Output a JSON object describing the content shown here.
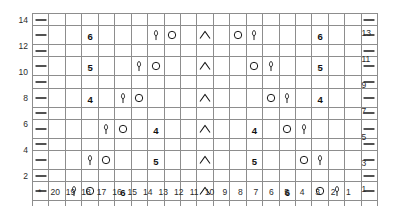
{
  "chart_data": {
    "type": "table",
    "grid": {
      "columns": 21,
      "rows": 14
    },
    "column_labels": [
      "*",
      "20",
      "19",
      "18",
      "17",
      "16",
      "15",
      "14",
      "13",
      "12",
      "11",
      "10",
      "9",
      "8",
      "7",
      "6",
      "5",
      "4",
      "3",
      "2",
      "1"
    ],
    "row_labels_left": [
      "14",
      "",
      "12",
      "",
      "10",
      "",
      "8",
      "",
      "6",
      "",
      "4",
      "",
      "2",
      ""
    ],
    "row_labels_right": [
      "",
      "13",
      "",
      "11",
      "",
      "9",
      "",
      "7",
      "",
      "5",
      "",
      "3",
      "",
      "1"
    ],
    "row_order_top_to_bottom": [
      14,
      13,
      12,
      11,
      10,
      9,
      8,
      7,
      6,
      5,
      4,
      3,
      2,
      1
    ],
    "symbol_legend": {
      "dash": "purl / selvedge marker",
      "circle": "yarn over",
      "lifted": "make-one lifted stitch",
      "chevron": "centered double decrease",
      "number": "cable or repeat count"
    },
    "colors": {
      "grid_line": "#8d8d8d",
      "frame": "#5a5a5a",
      "symbol": "#1a1a1a",
      "label": "#2b2b2b"
    },
    "rows": [
      {
        "row": 14,
        "cells": [
          {
            "col": "*",
            "symbol": "dash"
          },
          {
            "col": "20"
          },
          {
            "col": "19"
          },
          {
            "col": "18"
          },
          {
            "col": "17"
          },
          {
            "col": "16"
          },
          {
            "col": "15"
          },
          {
            "col": "14"
          },
          {
            "col": "13"
          },
          {
            "col": "12"
          },
          {
            "col": "11"
          },
          {
            "col": "10"
          },
          {
            "col": "9"
          },
          {
            "col": "8"
          },
          {
            "col": "7"
          },
          {
            "col": "6"
          },
          {
            "col": "5"
          },
          {
            "col": "4"
          },
          {
            "col": "3"
          },
          {
            "col": "2"
          },
          {
            "col": "1",
            "symbol": "dash"
          }
        ]
      },
      {
        "row": 13,
        "cells": [
          {
            "col": "*",
            "symbol": "dash"
          },
          {
            "col": "20"
          },
          {
            "col": "19"
          },
          {
            "col": "18",
            "symbol": "number",
            "text": "6"
          },
          {
            "col": "17"
          },
          {
            "col": "16"
          },
          {
            "col": "15"
          },
          {
            "col": "14",
            "symbol": "lifted"
          },
          {
            "col": "13",
            "symbol": "circle"
          },
          {
            "col": "12"
          },
          {
            "col": "11",
            "symbol": "chevron"
          },
          {
            "col": "10"
          },
          {
            "col": "9",
            "symbol": "circle"
          },
          {
            "col": "8",
            "symbol": "lifted"
          },
          {
            "col": "7"
          },
          {
            "col": "6"
          },
          {
            "col": "5"
          },
          {
            "col": "4",
            "symbol": "number",
            "text": "6"
          },
          {
            "col": "3"
          },
          {
            "col": "2"
          },
          {
            "col": "1",
            "symbol": "dash"
          }
        ]
      },
      {
        "row": 12,
        "cells": [
          {
            "col": "*",
            "symbol": "dash"
          },
          {
            "col": "20"
          },
          {
            "col": "19"
          },
          {
            "col": "18"
          },
          {
            "col": "17"
          },
          {
            "col": "16"
          },
          {
            "col": "15"
          },
          {
            "col": "14"
          },
          {
            "col": "13"
          },
          {
            "col": "12"
          },
          {
            "col": "11"
          },
          {
            "col": "10"
          },
          {
            "col": "9"
          },
          {
            "col": "8"
          },
          {
            "col": "7"
          },
          {
            "col": "6"
          },
          {
            "col": "5"
          },
          {
            "col": "4"
          },
          {
            "col": "3"
          },
          {
            "col": "2"
          },
          {
            "col": "1",
            "symbol": "dash"
          }
        ]
      },
      {
        "row": 11,
        "cells": [
          {
            "col": "*",
            "symbol": "dash"
          },
          {
            "col": "20"
          },
          {
            "col": "19"
          },
          {
            "col": "18",
            "symbol": "number",
            "text": "5"
          },
          {
            "col": "17"
          },
          {
            "col": "16"
          },
          {
            "col": "15",
            "symbol": "lifted"
          },
          {
            "col": "14",
            "symbol": "circle"
          },
          {
            "col": "13"
          },
          {
            "col": "12"
          },
          {
            "col": "11",
            "symbol": "chevron"
          },
          {
            "col": "10"
          },
          {
            "col": "9"
          },
          {
            "col": "8",
            "symbol": "circle"
          },
          {
            "col": "7",
            "symbol": "lifted"
          },
          {
            "col": "6"
          },
          {
            "col": "5"
          },
          {
            "col": "4",
            "symbol": "number",
            "text": "5"
          },
          {
            "col": "3"
          },
          {
            "col": "2"
          },
          {
            "col": "1",
            "symbol": "dash"
          }
        ]
      },
      {
        "row": 10,
        "cells": [
          {
            "col": "*",
            "symbol": "dash"
          },
          {
            "col": "20"
          },
          {
            "col": "19"
          },
          {
            "col": "18"
          },
          {
            "col": "17"
          },
          {
            "col": "16"
          },
          {
            "col": "15"
          },
          {
            "col": "14"
          },
          {
            "col": "13"
          },
          {
            "col": "12"
          },
          {
            "col": "11"
          },
          {
            "col": "10"
          },
          {
            "col": "9"
          },
          {
            "col": "8"
          },
          {
            "col": "7"
          },
          {
            "col": "6"
          },
          {
            "col": "5"
          },
          {
            "col": "4"
          },
          {
            "col": "3"
          },
          {
            "col": "2"
          },
          {
            "col": "1",
            "symbol": "dash"
          }
        ]
      },
      {
        "row": 9,
        "cells": [
          {
            "col": "*",
            "symbol": "dash"
          },
          {
            "col": "20"
          },
          {
            "col": "19"
          },
          {
            "col": "18",
            "symbol": "number",
            "text": "4"
          },
          {
            "col": "17"
          },
          {
            "col": "16",
            "symbol": "lifted"
          },
          {
            "col": "15",
            "symbol": "circle"
          },
          {
            "col": "14"
          },
          {
            "col": "13"
          },
          {
            "col": "12"
          },
          {
            "col": "11",
            "symbol": "chevron"
          },
          {
            "col": "10"
          },
          {
            "col": "9"
          },
          {
            "col": "8"
          },
          {
            "col": "7",
            "symbol": "circle"
          },
          {
            "col": "6",
            "symbol": "lifted"
          },
          {
            "col": "5"
          },
          {
            "col": "4",
            "symbol": "number",
            "text": "4"
          },
          {
            "col": "3"
          },
          {
            "col": "2"
          },
          {
            "col": "1",
            "symbol": "dash"
          }
        ]
      },
      {
        "row": 8,
        "cells": [
          {
            "col": "*",
            "symbol": "dash"
          },
          {
            "col": "20"
          },
          {
            "col": "19"
          },
          {
            "col": "18"
          },
          {
            "col": "17"
          },
          {
            "col": "16"
          },
          {
            "col": "15"
          },
          {
            "col": "14"
          },
          {
            "col": "13"
          },
          {
            "col": "12"
          },
          {
            "col": "11"
          },
          {
            "col": "10"
          },
          {
            "col": "9"
          },
          {
            "col": "8"
          },
          {
            "col": "7"
          },
          {
            "col": "6"
          },
          {
            "col": "5"
          },
          {
            "col": "4"
          },
          {
            "col": "3"
          },
          {
            "col": "2"
          },
          {
            "col": "1",
            "symbol": "dash"
          }
        ]
      },
      {
        "row": 7,
        "cells": [
          {
            "col": "*",
            "symbol": "dash"
          },
          {
            "col": "20"
          },
          {
            "col": "19"
          },
          {
            "col": "18"
          },
          {
            "col": "17",
            "symbol": "lifted"
          },
          {
            "col": "16",
            "symbol": "circle"
          },
          {
            "col": "15"
          },
          {
            "col": "14",
            "symbol": "number",
            "text": "4"
          },
          {
            "col": "13"
          },
          {
            "col": "12"
          },
          {
            "col": "11",
            "symbol": "chevron"
          },
          {
            "col": "10"
          },
          {
            "col": "9"
          },
          {
            "col": "8",
            "symbol": "number",
            "text": "4"
          },
          {
            "col": "7"
          },
          {
            "col": "6",
            "symbol": "circle"
          },
          {
            "col": "5",
            "symbol": "lifted"
          },
          {
            "col": "4"
          },
          {
            "col": "3"
          },
          {
            "col": "2"
          },
          {
            "col": "1",
            "symbol": "dash"
          }
        ]
      },
      {
        "row": 6,
        "cells": [
          {
            "col": "*",
            "symbol": "dash"
          },
          {
            "col": "20"
          },
          {
            "col": "19"
          },
          {
            "col": "18"
          },
          {
            "col": "17"
          },
          {
            "col": "16"
          },
          {
            "col": "15"
          },
          {
            "col": "14"
          },
          {
            "col": "13"
          },
          {
            "col": "12"
          },
          {
            "col": "11"
          },
          {
            "col": "10"
          },
          {
            "col": "9"
          },
          {
            "col": "8"
          },
          {
            "col": "7"
          },
          {
            "col": "6"
          },
          {
            "col": "5"
          },
          {
            "col": "4"
          },
          {
            "col": "3"
          },
          {
            "col": "2"
          },
          {
            "col": "1",
            "symbol": "dash"
          }
        ]
      },
      {
        "row": 5,
        "cells": [
          {
            "col": "*",
            "symbol": "dash"
          },
          {
            "col": "20"
          },
          {
            "col": "19"
          },
          {
            "col": "18",
            "symbol": "lifted"
          },
          {
            "col": "17",
            "symbol": "circle"
          },
          {
            "col": "16"
          },
          {
            "col": "15"
          },
          {
            "col": "14",
            "symbol": "number",
            "text": "5"
          },
          {
            "col": "13"
          },
          {
            "col": "12"
          },
          {
            "col": "11",
            "symbol": "chevron"
          },
          {
            "col": "10"
          },
          {
            "col": "9"
          },
          {
            "col": "8",
            "symbol": "number",
            "text": "5"
          },
          {
            "col": "7"
          },
          {
            "col": "6"
          },
          {
            "col": "5",
            "symbol": "circle"
          },
          {
            "col": "4",
            "symbol": "lifted"
          },
          {
            "col": "3"
          },
          {
            "col": "2"
          },
          {
            "col": "1",
            "symbol": "dash"
          }
        ]
      },
      {
        "row": 4,
        "cells": [
          {
            "col": "*",
            "symbol": "dash"
          },
          {
            "col": "20"
          },
          {
            "col": "19"
          },
          {
            "col": "18"
          },
          {
            "col": "17"
          },
          {
            "col": "16"
          },
          {
            "col": "15"
          },
          {
            "col": "14"
          },
          {
            "col": "13"
          },
          {
            "col": "12"
          },
          {
            "col": "11"
          },
          {
            "col": "10"
          },
          {
            "col": "9"
          },
          {
            "col": "8"
          },
          {
            "col": "7"
          },
          {
            "col": "6"
          },
          {
            "col": "5"
          },
          {
            "col": "4"
          },
          {
            "col": "3"
          },
          {
            "col": "2"
          },
          {
            "col": "1",
            "symbol": "dash"
          }
        ]
      },
      {
        "row": 3,
        "cells": [
          {
            "col": "*",
            "symbol": "dash"
          },
          {
            "col": "20"
          },
          {
            "col": "19",
            "symbol": "lifted"
          },
          {
            "col": "18",
            "symbol": "circle"
          },
          {
            "col": "17"
          },
          {
            "col": "16",
            "symbol": "number",
            "text": "6"
          },
          {
            "col": "15"
          },
          {
            "col": "14"
          },
          {
            "col": "13"
          },
          {
            "col": "12"
          },
          {
            "col": "11",
            "symbol": "chevron"
          },
          {
            "col": "10"
          },
          {
            "col": "9"
          },
          {
            "col": "8"
          },
          {
            "col": "7"
          },
          {
            "col": "6",
            "symbol": "number",
            "text": "6"
          },
          {
            "col": "5"
          },
          {
            "col": "4",
            "symbol": "circle"
          },
          {
            "col": "3",
            "symbol": "lifted"
          },
          {
            "col": "2"
          },
          {
            "col": "1",
            "symbol": "dash"
          }
        ]
      },
      {
        "row": 2,
        "cells": [
          {
            "col": "*",
            "symbol": "dash"
          },
          {
            "col": "20"
          },
          {
            "col": "19"
          },
          {
            "col": "18"
          },
          {
            "col": "17"
          },
          {
            "col": "16"
          },
          {
            "col": "15"
          },
          {
            "col": "14"
          },
          {
            "col": "13"
          },
          {
            "col": "12"
          },
          {
            "col": "11"
          },
          {
            "col": "10"
          },
          {
            "col": "9"
          },
          {
            "col": "8"
          },
          {
            "col": "7"
          },
          {
            "col": "6"
          },
          {
            "col": "5"
          },
          {
            "col": "4"
          },
          {
            "col": "3"
          },
          {
            "col": "2"
          },
          {
            "col": "1",
            "symbol": "dash"
          }
        ]
      },
      {
        "row": 1,
        "cells": [
          {
            "col": "*",
            "symbol": "dash"
          },
          {
            "col": "20"
          },
          {
            "col": "19",
            "symbol": "circle"
          },
          {
            "col": "18"
          },
          {
            "col": "17"
          },
          {
            "col": "16",
            "symbol": "number",
            "text": "7"
          },
          {
            "col": "15"
          },
          {
            "col": "14"
          },
          {
            "col": "13"
          },
          {
            "col": "12"
          },
          {
            "col": "11",
            "symbol": "chevron"
          },
          {
            "col": "10"
          },
          {
            "col": "9"
          },
          {
            "col": "8"
          },
          {
            "col": "7"
          },
          {
            "col": "6",
            "symbol": "number",
            "text": "7"
          },
          {
            "col": "5"
          },
          {
            "col": "4"
          },
          {
            "col": "3",
            "symbol": "circle"
          },
          {
            "col": "2"
          },
          {
            "col": "1",
            "symbol": "dash"
          }
        ]
      }
    ]
  }
}
